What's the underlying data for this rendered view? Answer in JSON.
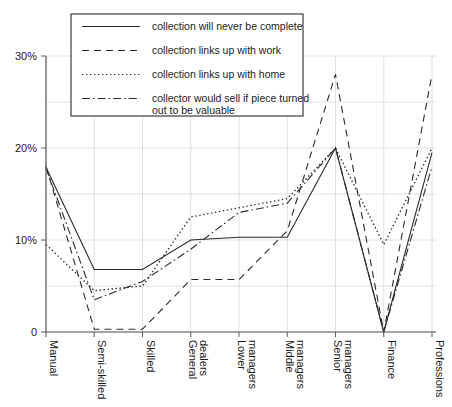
{
  "chart_data": {
    "type": "line",
    "title": "",
    "xlabel": "",
    "ylabel": "",
    "ylim": [
      0,
      30
    ],
    "yticks": [
      0,
      10,
      20,
      30
    ],
    "ytick_labels": [
      "0",
      "10%",
      "20%",
      "30%"
    ],
    "grid": true,
    "legend_position": "top-center",
    "categories": [
      "Manual",
      "Semi-skilled",
      "Skilled",
      "General dealers",
      "Lower managers",
      "Middle managers",
      "Senior managers",
      "Finance",
      "Professions"
    ],
    "series": [
      {
        "name": "collection will never be complete",
        "style": "solid",
        "values": [
          17.9,
          6.8,
          6.8,
          10.0,
          10.3,
          10.3,
          20.0,
          0.0,
          19.5
        ]
      },
      {
        "name": "collection links up with work",
        "style": "dashed",
        "values": [
          18.0,
          0.3,
          0.3,
          5.7,
          5.7,
          11.0,
          28.0,
          0.0,
          28.0
        ]
      },
      {
        "name": "collection links up with home",
        "style": "dotted",
        "values": [
          9.5,
          4.5,
          5.0,
          12.5,
          13.5,
          14.5,
          20.0,
          9.5,
          20.0
        ]
      },
      {
        "name": "collector would sell if piece turned out to be valuable",
        "style": "dashdot",
        "values": [
          17.8,
          3.5,
          5.5,
          9.0,
          13.0,
          14.0,
          20.0,
          0.0,
          18.0
        ]
      }
    ]
  },
  "legend": {
    "entries": [
      {
        "label": "collection will never be complete",
        "style": "solid"
      },
      {
        "label": "collection links up with work",
        "style": "dashed"
      },
      {
        "label": "collection links up with home",
        "style": "dotted"
      },
      {
        "label": "collector would sell if piece turned",
        "style": "dashdot"
      },
      {
        "label": "out to be valuable",
        "style": "none"
      }
    ]
  },
  "colors": {
    "ink": "#2a2a2a",
    "grid": "#d8d8d8",
    "axis": "#5a5a5a",
    "background": "#ffffff"
  }
}
